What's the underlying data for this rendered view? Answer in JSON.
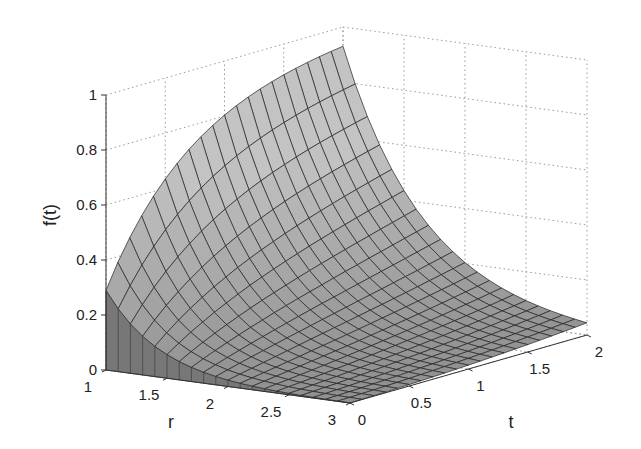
{
  "chart_data": {
    "type": "surface3d",
    "title": "",
    "xlabel": "r",
    "ylabel": "t",
    "zlabel": "f(t)",
    "x_range": [
      1,
      3
    ],
    "y_range": [
      0,
      2
    ],
    "z_range": [
      0,
      1
    ],
    "x_ticks": [
      "1",
      "1.5",
      "2",
      "2.5",
      "3"
    ],
    "y_ticks": [
      "0",
      "0.5",
      "1",
      "1.5",
      "2"
    ],
    "z_ticks": [
      "0",
      "0.2",
      "0.4",
      "0.6",
      "0.8",
      "1"
    ],
    "grid": true,
    "colormap": "gray",
    "mesh_rows": 20,
    "mesh_cols": 20,
    "corner_values": {
      "r1_t0": 0.29,
      "r1_t2": 0.93,
      "r3_t0": 0.0,
      "r3_t2": 0.1
    }
  }
}
